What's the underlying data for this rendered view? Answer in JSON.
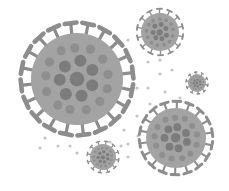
{
  "illustration": {
    "subject": "coronavirus particles",
    "colors": {
      "background": "#ffffff",
      "body": "#a3a3a3",
      "spot": "#7c7c7c",
      "spot_light": "#8e8e8e",
      "spike": "#8d8d8d",
      "dot": "#c4c4c4"
    },
    "viruses": [
      {
        "name": "large-virus",
        "cx": 77,
        "cy": 79,
        "r": 46,
        "spikes": 20
      },
      {
        "name": "top-right-virus",
        "cx": 160,
        "cy": 32,
        "r": 19,
        "spikes": 14
      },
      {
        "name": "small-right-virus",
        "cx": 197,
        "cy": 83,
        "r": 9,
        "spikes": 10
      },
      {
        "name": "bottom-right-virus",
        "cx": 176,
        "cy": 138,
        "r": 30,
        "spikes": 18
      },
      {
        "name": "bottom-small-virus",
        "cx": 103,
        "cy": 157,
        "r": 13,
        "spikes": 12
      }
    ],
    "dots": [
      [
        128,
        40
      ],
      [
        148,
        62
      ],
      [
        160,
        74
      ],
      [
        172,
        70
      ],
      [
        148,
        88
      ],
      [
        165,
        92
      ],
      [
        180,
        98
      ],
      [
        150,
        104
      ],
      [
        137,
        116
      ],
      [
        124,
        130
      ],
      [
        138,
        136
      ],
      [
        128,
        144
      ],
      [
        70,
        146
      ],
      [
        58,
        146
      ],
      [
        45,
        138
      ],
      [
        40,
        148
      ],
      [
        77,
        153
      ],
      [
        110,
        142
      ],
      [
        121,
        146
      ],
      [
        128,
        157
      ],
      [
        160,
        60
      ],
      [
        137,
        88
      ]
    ]
  }
}
